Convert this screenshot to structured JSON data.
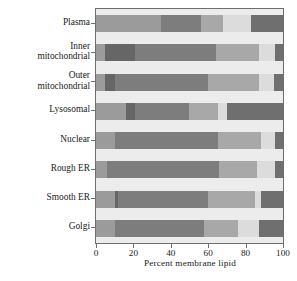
{
  "chart_data": {
    "type": "bar",
    "orientation": "horizontal",
    "stacked": true,
    "title": "",
    "xlabel": "Percent membrane lipid",
    "ylabel": "Rat hepatocyte membrane type",
    "xlim": [
      0,
      100
    ],
    "xticks": [
      0,
      20,
      40,
      60,
      80,
      100
    ],
    "xticklabels": [
      "0",
      "20",
      "40",
      "60",
      "80",
      "100"
    ],
    "grid": false,
    "legend": "none",
    "categories": [
      "Plasma",
      "Inner mitochondrial",
      "Outer mitochondrial",
      "Lysosomal",
      "Nuclear",
      "Rough ER",
      "Smooth ER",
      "Golgi"
    ],
    "series": [
      {
        "name": "segment-1",
        "color": "#9b9b9b",
        "values": [
          35,
          5,
          5,
          16,
          10,
          6,
          10,
          10
        ]
      },
      {
        "name": "segment-2",
        "color": "#666666",
        "values": [
          0,
          16,
          5,
          5,
          0,
          0,
          2,
          0
        ]
      },
      {
        "name": "segment-3",
        "color": "#7d7d7d",
        "values": [
          21,
          43,
          50,
          29,
          55,
          60,
          48,
          48
        ]
      },
      {
        "name": "segment-4",
        "color": "#a8a8a8",
        "values": [
          12,
          23,
          27,
          15,
          23,
          20,
          25,
          18
        ]
      },
      {
        "name": "segment-5",
        "color": "#dcdcdc",
        "values": [
          15,
          9,
          8,
          5,
          8,
          10,
          3,
          11
        ]
      },
      {
        "name": "segment-6",
        "color": "#6f6f6f",
        "values": [
          17,
          4,
          5,
          30,
          4,
          4,
          12,
          13
        ]
      }
    ],
    "cumulative_boundaries": [
      [
        35,
        35,
        56,
        68,
        83,
        100
      ],
      [
        5,
        21,
        64,
        87,
        96,
        100
      ],
      [
        5,
        10,
        60,
        87,
        95,
        100
      ],
      [
        16,
        21,
        50,
        65,
        70,
        100
      ],
      [
        10,
        10,
        65,
        88,
        96,
        100
      ],
      [
        6,
        6,
        66,
        86,
        96,
        100
      ],
      [
        10,
        12,
        60,
        85,
        88,
        100
      ],
      [
        10,
        10,
        58,
        76,
        87,
        100
      ]
    ]
  },
  "colors": {
    "plot_background": "#ececed",
    "frame": "#6e6e6e",
    "text": "#1a1a1a",
    "page_background": "#ffffff"
  }
}
